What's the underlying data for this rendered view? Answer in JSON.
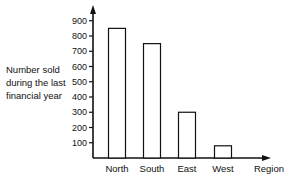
{
  "chart_data": {
    "type": "bar",
    "title": "",
    "xlabel": "Region",
    "ylabel": "Number sold during the last financial year",
    "ylabel_lines": [
      "Number sold",
      "during the last",
      "financial year"
    ],
    "categories": [
      "North",
      "South",
      "East",
      "West"
    ],
    "values": [
      850,
      750,
      300,
      80
    ],
    "yticks": [
      100,
      200,
      300,
      400,
      500,
      600,
      700,
      800,
      900
    ],
    "ylim": [
      0,
      900
    ],
    "grid": false,
    "legend": null
  }
}
